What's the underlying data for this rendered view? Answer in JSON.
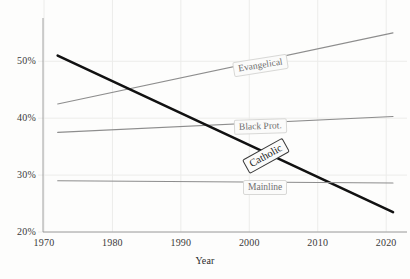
{
  "chart_data": {
    "type": "line",
    "title": "",
    "xlabel": "Year",
    "ylabel": "",
    "xlim": [
      1970,
      2021
    ],
    "ylim": [
      20,
      55.5
    ],
    "grid": true,
    "legend_position": "inline-labels",
    "x_ticks": [
      "1970",
      "1980",
      "1990",
      "2000",
      "2010",
      "2020"
    ],
    "x_tick_values": [
      1970,
      1980,
      1990,
      2000,
      2010,
      2020
    ],
    "y_ticks": [
      "20%",
      "30%",
      "40%",
      "50%"
    ],
    "y_tick_values": [
      20,
      30,
      40,
      50
    ],
    "series": [
      {
        "name": "Evangelical",
        "color": "#8d8d8d",
        "x": [
          1972,
          2021
        ],
        "values": [
          42.5,
          55.0
        ],
        "label": "Evangelical"
      },
      {
        "name": "Black Prot.",
        "color": "#8d8d8d",
        "x": [
          1972,
          2021
        ],
        "values": [
          37.5,
          40.3
        ],
        "label": "Black Prot."
      },
      {
        "name": "Catholic",
        "color": "#111111",
        "x": [
          1972,
          2021
        ],
        "values": [
          51.0,
          23.5
        ],
        "label": "Catholic"
      },
      {
        "name": "Mainline",
        "color": "#8d8d8d",
        "x": [
          1972,
          2021
        ],
        "values": [
          29.0,
          28.6
        ],
        "label": "Mainline"
      }
    ]
  },
  "axis": {
    "x_title": "Year"
  },
  "labels": {
    "evangelical": "Evangelical",
    "black_prot": "Black Prot.",
    "catholic": "Catholic",
    "mainline": "Mainline"
  },
  "colors": {
    "background": "#fdfdfc",
    "grid": "#ececea",
    "axis": "#8a8a8a",
    "series_gray": "#8d8d8d",
    "series_dark": "#111111",
    "label_text": "#6f6f6f",
    "tick_text": "#3a3a3a"
  }
}
